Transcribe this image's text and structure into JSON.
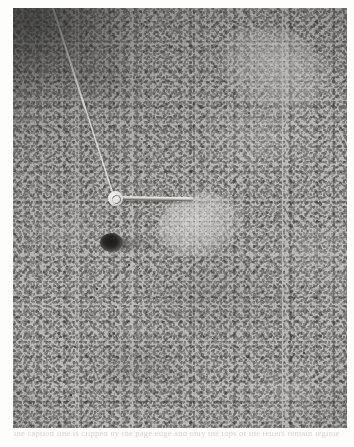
{
  "page": {
    "background_color": "#fdfdfc",
    "type": "scanned-photographic-plate"
  },
  "plate": {
    "label": "photomicrograph",
    "description": "Grayscale photomicrograph of densely packed cells (histological section) with uneven illumination, darker toward the upper-left corner.",
    "base_tone_color": "#b8b7b3",
    "dark_tone_color": "#55544f",
    "light_tone_color": "#d8d7d3",
    "bounds": {
      "x": 13,
      "y": 8,
      "width": 334,
      "height": 420
    }
  },
  "annotations": {
    "pin_head": {
      "name": "pin-head",
      "color": "#eceae5",
      "center_x": 102,
      "center_y": 190,
      "diameter": 15
    },
    "needle": {
      "name": "needle-pointer",
      "color": "#e4e2dc",
      "start_x": 108,
      "start_y": 190,
      "end_x": 180,
      "end_y": 191,
      "length": 72
    },
    "thread": {
      "name": "guide-thread",
      "color": "#efeee9",
      "start_x": 40,
      "start_y": 0,
      "end_x": 100,
      "end_y": 185
    },
    "ink_blob": {
      "name": "ink-marking",
      "color": "#1a1a18",
      "center_x": 98,
      "center_y": 234,
      "width": 23,
      "height": 19
    },
    "flecks": [
      {
        "x": 74,
        "y": 346,
        "size": 2.2
      },
      {
        "x": 128,
        "y": 264,
        "size": 1.8
      },
      {
        "x": 139,
        "y": 268,
        "size": 1.4
      },
      {
        "x": 303,
        "y": 352,
        "size": 2.0
      },
      {
        "x": 96,
        "y": 288,
        "size": 1.5
      },
      {
        "x": 248,
        "y": 112,
        "size": 1.6
      },
      {
        "x": 185,
        "y": 276,
        "size": 1.3
      },
      {
        "x": 262,
        "y": 300,
        "size": 1.4
      }
    ],
    "pale_regions": [
      {
        "name": "pale-centre-ovoid",
        "center_x": 196,
        "center_y": 220,
        "width": 84,
        "height": 62
      },
      {
        "name": "pale-upper-right",
        "center_x": 280,
        "center_y": 60,
        "width": 110,
        "height": 78
      }
    ]
  },
  "caption": {
    "text": "the caption line is clipped by the page edge and only the tops of the letters remain legible"
  }
}
